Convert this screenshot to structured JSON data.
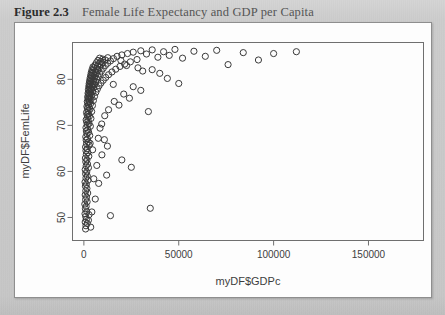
{
  "figure": {
    "number": "Figure 2.3",
    "title": "Female Life Expectancy and GDP per Capita"
  },
  "colors": {
    "page_background": "#c9c9c9",
    "card_background": "#fdfdfd",
    "card_border": "#8e8e8e",
    "axis": "#6f6f6f",
    "point_stroke": "#3a3a3a",
    "caption_number": "#2c2c2c",
    "caption_text": "#555555"
  },
  "chart_data": {
    "type": "scatter",
    "title": "Female Life Expectancy and GDP per Capita",
    "xlabel": "myDF$GDPc",
    "ylabel": "myDF$FemLife",
    "xlim": [
      -6000,
      179000
    ],
    "ylim": [
      45.0,
      88.0
    ],
    "xticks": [
      0,
      50000,
      100000,
      150000
    ],
    "xtick_labels": [
      "0",
      "50000",
      "100000",
      "150000"
    ],
    "yticks": [
      50,
      60,
      70,
      80
    ],
    "ytick_labels": [
      "50",
      "60",
      "70",
      "80"
    ],
    "grid": false,
    "legend": null,
    "marker": "open-circle",
    "marker_size": 3.1,
    "points": [
      [
        900,
        47.5
      ],
      [
        1100,
        48.2
      ],
      [
        700,
        49.0
      ],
      [
        1300,
        49.6
      ],
      [
        950,
        50.2
      ],
      [
        600,
        50.8
      ],
      [
        1500,
        51.3
      ],
      [
        800,
        51.9
      ],
      [
        1200,
        52.4
      ],
      [
        500,
        52.9
      ],
      [
        1700,
        53.4
      ],
      [
        900,
        53.9
      ],
      [
        1400,
        54.4
      ],
      [
        700,
        54.9
      ],
      [
        2000,
        55.3
      ],
      [
        1000,
        55.8
      ],
      [
        1600,
        56.3
      ],
      [
        800,
        56.8
      ],
      [
        1300,
        57.2
      ],
      [
        600,
        57.7
      ],
      [
        2200,
        58.1
      ],
      [
        1100,
        58.6
      ],
      [
        1800,
        59.0
      ],
      [
        900,
        59.5
      ],
      [
        1500,
        59.9
      ],
      [
        700,
        60.4
      ],
      [
        2400,
        60.8
      ],
      [
        1200,
        61.2
      ],
      [
        1900,
        61.6
      ],
      [
        1000,
        62.1
      ],
      [
        1600,
        62.5
      ],
      [
        800,
        62.9
      ],
      [
        2600,
        63.3
      ],
      [
        1300,
        63.7
      ],
      [
        2100,
        64.1
      ],
      [
        1100,
        64.5
      ],
      [
        1700,
        64.9
      ],
      [
        900,
        65.3
      ],
      [
        2800,
        65.7
      ],
      [
        1400,
        66.0
      ],
      [
        2300,
        66.4
      ],
      [
        1200,
        66.8
      ],
      [
        1900,
        67.1
      ],
      [
        1000,
        67.5
      ],
      [
        3100,
        67.8
      ],
      [
        1600,
        68.2
      ],
      [
        2500,
        68.5
      ],
      [
        1300,
        68.8
      ],
      [
        2100,
        69.1
      ],
      [
        1100,
        69.5
      ],
      [
        3400,
        69.8
      ],
      [
        1800,
        70.1
      ],
      [
        2700,
        70.4
      ],
      [
        1500,
        70.7
      ],
      [
        2300,
        71.0
      ],
      [
        1200,
        71.2
      ],
      [
        3700,
        71.5
      ],
      [
        2000,
        71.8
      ],
      [
        2900,
        72.0
      ],
      [
        1700,
        72.3
      ],
      [
        2500,
        72.5
      ],
      [
        1400,
        72.8
      ],
      [
        4100,
        73.0
      ],
      [
        2200,
        73.2
      ],
      [
        3200,
        73.5
      ],
      [
        1900,
        73.7
      ],
      [
        2700,
        73.9
      ],
      [
        1600,
        74.1
      ],
      [
        4500,
        74.3
      ],
      [
        2400,
        74.5
      ],
      [
        3500,
        74.7
      ],
      [
        2100,
        74.9
      ],
      [
        3000,
        75.1
      ],
      [
        1800,
        75.2
      ],
      [
        5000,
        75.4
      ],
      [
        2600,
        75.6
      ],
      [
        3800,
        75.7
      ],
      [
        2300,
        75.9
      ],
      [
        3300,
        76.0
      ],
      [
        2000,
        76.2
      ],
      [
        5600,
        76.3
      ],
      [
        2900,
        76.5
      ],
      [
        4200,
        76.6
      ],
      [
        2500,
        76.8
      ],
      [
        3600,
        76.9
      ],
      [
        2200,
        77.0
      ],
      [
        6300,
        77.2
      ],
      [
        3100,
        77.3
      ],
      [
        4600,
        77.4
      ],
      [
        2700,
        77.6
      ],
      [
        3900,
        77.7
      ],
      [
        2400,
        77.8
      ],
      [
        7100,
        77.9
      ],
      [
        3400,
        78.0
      ],
      [
        5100,
        78.2
      ],
      [
        2900,
        78.3
      ],
      [
        4300,
        78.4
      ],
      [
        2600,
        78.5
      ],
      [
        8000,
        78.6
      ],
      [
        3700,
        78.7
      ],
      [
        5600,
        78.8
      ],
      [
        3100,
        78.9
      ],
      [
        4700,
        79.0
      ],
      [
        2800,
        79.1
      ],
      [
        9000,
        79.2
      ],
      [
        4000,
        79.3
      ],
      [
        6200,
        79.4
      ],
      [
        3400,
        79.5
      ],
      [
        5100,
        79.6
      ],
      [
        3000,
        79.7
      ],
      [
        10200,
        79.8
      ],
      [
        4400,
        79.9
      ],
      [
        6800,
        80.0
      ],
      [
        3700,
        80.1
      ],
      [
        5600,
        80.2
      ],
      [
        3300,
        80.3
      ],
      [
        11500,
        80.4
      ],
      [
        4800,
        80.5
      ],
      [
        7500,
        80.6
      ],
      [
        4000,
        80.7
      ],
      [
        6100,
        80.8
      ],
      [
        3600,
        80.9
      ],
      [
        13000,
        81.0
      ],
      [
        5300,
        81.1
      ],
      [
        8300,
        81.2
      ],
      [
        4400,
        81.3
      ],
      [
        6700,
        81.4
      ],
      [
        3900,
        81.5
      ],
      [
        14800,
        81.6
      ],
      [
        5900,
        81.7
      ],
      [
        9200,
        81.8
      ],
      [
        4800,
        81.9
      ],
      [
        7400,
        82.0
      ],
      [
        4300,
        82.1
      ],
      [
        16800,
        82.2
      ],
      [
        6500,
        82.3
      ],
      [
        10200,
        82.4
      ],
      [
        5300,
        82.5
      ],
      [
        8200,
        82.6
      ],
      [
        4800,
        82.7
      ],
      [
        19000,
        82.8
      ],
      [
        7200,
        82.9
      ],
      [
        11300,
        83.0
      ],
      [
        5900,
        83.1
      ],
      [
        9100,
        83.2
      ],
      [
        21500,
        83.3
      ],
      [
        8000,
        83.4
      ],
      [
        12500,
        83.5
      ],
      [
        6600,
        83.6
      ],
      [
        10100,
        83.7
      ],
      [
        24500,
        83.8
      ],
      [
        8900,
        83.9
      ],
      [
        14000,
        84.0
      ],
      [
        7400,
        84.1
      ],
      [
        11300,
        84.2
      ],
      [
        28000,
        84.3
      ],
      [
        9900,
        84.4
      ],
      [
        15600,
        84.5
      ],
      [
        8300,
        84.6
      ],
      [
        12600,
        84.7
      ],
      [
        17500,
        85.0
      ],
      [
        20000,
        85.3
      ],
      [
        23000,
        85.6
      ],
      [
        26000,
        85.9
      ],
      [
        30000,
        86.2
      ],
      [
        33000,
        85.5
      ],
      [
        36000,
        86.4
      ],
      [
        39000,
        84.8
      ],
      [
        42000,
        86.0
      ],
      [
        45000,
        85.2
      ],
      [
        48000,
        86.5
      ],
      [
        52000,
        84.6
      ],
      [
        58000,
        86.1
      ],
      [
        64000,
        85.0
      ],
      [
        70000,
        86.3
      ],
      [
        76000,
        83.2
      ],
      [
        84000,
        85.8
      ],
      [
        92000,
        84.2
      ],
      [
        100000,
        85.6
      ],
      [
        112000,
        86.0
      ],
      [
        36000,
        82.1
      ],
      [
        40000,
        81.3
      ],
      [
        44000,
        80.2
      ],
      [
        50000,
        79.1
      ],
      [
        26000,
        78.4
      ],
      [
        30000,
        77.6
      ],
      [
        21000,
        76.8
      ],
      [
        24000,
        75.9
      ],
      [
        16000,
        75.2
      ],
      [
        18500,
        74.4
      ],
      [
        34000,
        73.0
      ],
      [
        20000,
        62.5
      ],
      [
        25000,
        60.9
      ],
      [
        35000,
        52.0
      ],
      [
        14000,
        50.4
      ],
      [
        9500,
        63.6
      ],
      [
        13000,
        73.4
      ],
      [
        15500,
        78.9
      ],
      [
        11000,
        72.1
      ],
      [
        8500,
        69.4
      ],
      [
        19500,
        84.1
      ],
      [
        22500,
        83.0
      ],
      [
        28500,
        82.5
      ],
      [
        31000,
        81.8
      ],
      [
        12000,
        59.2
      ],
      [
        7800,
        57.4
      ],
      [
        6000,
        54.0
      ],
      [
        4200,
        51.2
      ],
      [
        2400,
        49.4
      ],
      [
        3600,
        47.9
      ],
      [
        5200,
        58.4
      ],
      [
        6800,
        61.3
      ],
      [
        4600,
        64.7
      ],
      [
        3300,
        66.1
      ],
      [
        2700,
        50.6
      ],
      [
        1800,
        48.7
      ],
      [
        10800,
        66.9
      ],
      [
        9400,
        70.3
      ],
      [
        7600,
        67.2
      ],
      [
        12400,
        65.5
      ]
    ]
  }
}
